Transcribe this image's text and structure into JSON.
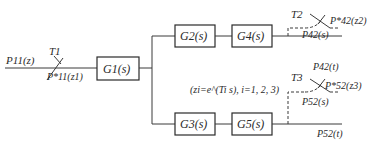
{
  "diagram": {
    "type": "block-diagram",
    "input": {
      "signal": "P11(z)",
      "sampler": "T1",
      "sampled": "P*11(z1)"
    },
    "blocks": [
      {
        "id": "G1",
        "label": "G1(s)"
      },
      {
        "id": "G2",
        "label": "G2(s)"
      },
      {
        "id": "G4",
        "label": "G4(s)"
      },
      {
        "id": "G3",
        "label": "G3(s)"
      },
      {
        "id": "G5",
        "label": "G5(s)"
      }
    ],
    "upper_output": {
      "sampler": "T2",
      "continuous": "P42(s)",
      "sampled": "P*42(z2)",
      "time_signal": "P42(t)"
    },
    "lower_output": {
      "sampler": "T3",
      "continuous": "P52(s)",
      "sampled": "P*52(z3)",
      "time_signal": "P52(t)"
    },
    "note": "(zi=e^(Ti s), i=1, 2, 3)"
  }
}
